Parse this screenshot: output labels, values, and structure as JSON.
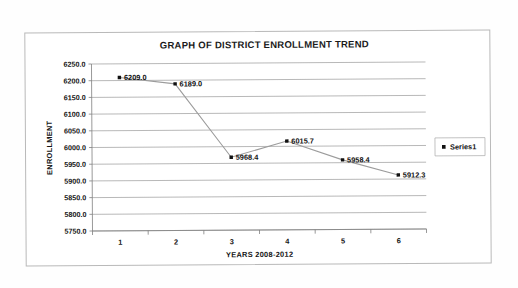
{
  "chart_data": {
    "type": "line",
    "title": "GRAPH OF DISTRICT ENROLLMENT TREND",
    "xlabel": "YEARS 2008-2012",
    "ylabel": "ENROLLMENT",
    "categories": [
      "1",
      "2",
      "3",
      "4",
      "5",
      "6"
    ],
    "values": [
      6209.0,
      6189.0,
      5968.4,
      6015.7,
      5958.4,
      5912.3
    ],
    "point_labels": [
      "6209.0",
      "6189.0",
      "5968.4",
      "6015.7",
      "5958.4",
      "5912.3"
    ],
    "ylim": [
      5750.0,
      6250.0
    ],
    "ytick_step": 50,
    "ytick_labels": [
      "6250.0",
      "6200.0",
      "6150.0",
      "6100.0",
      "6050.0",
      "6000.0",
      "5950.0",
      "5900.0",
      "5850.0",
      "5800.0",
      "5750.0"
    ],
    "ytick_values": [
      6250,
      6200,
      6150,
      6100,
      6050,
      6000,
      5950,
      5900,
      5850,
      5800,
      5750
    ],
    "grid": true,
    "legend_position": "right",
    "series": [
      {
        "name": "Series1",
        "values": [
          6209.0,
          6189.0,
          5968.4,
          6015.7,
          5958.4,
          5912.3
        ],
        "marker": "square",
        "marker_color": "#111111",
        "line_color": "#9c9c9c"
      }
    ]
  },
  "legend": {
    "entries": [
      {
        "label": "Series1"
      }
    ]
  }
}
